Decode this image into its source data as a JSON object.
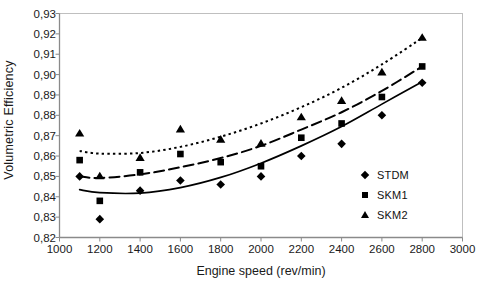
{
  "chart_data": {
    "type": "scatter",
    "title": "",
    "xlabel": "Engine speed (rev/min)",
    "ylabel": "Volumetric Efficiency",
    "xlim": [
      1000,
      3000
    ],
    "ylim": [
      0.82,
      0.93
    ],
    "xticks": [
      1000,
      1200,
      1400,
      1600,
      1800,
      2000,
      2200,
      2400,
      2600,
      2800,
      3000
    ],
    "xtick_labels": [
      "1000",
      "1200",
      "1400",
      "1600",
      "1800",
      "2000",
      "2200",
      "2400",
      "2600",
      "2800",
      "3000"
    ],
    "yticks": [
      0.82,
      0.83,
      0.84,
      0.85,
      0.86,
      0.87,
      0.88,
      0.89,
      0.9,
      0.91,
      0.92,
      0.93
    ],
    "ytick_labels": [
      "0,82",
      "0,83",
      "0,84",
      "0,85",
      "0,86",
      "0,87",
      "0,88",
      "0,89",
      "0,90",
      "0,91",
      "0,92",
      "0,93"
    ],
    "grid": false,
    "legend_position": "inside-right",
    "decimal_separator": ",",
    "x": [
      1100,
      1200,
      1400,
      1600,
      1800,
      2000,
      2200,
      2400,
      2600,
      2800
    ],
    "series": [
      {
        "name": "STDM",
        "marker": "diamond",
        "line_style": "solid",
        "color": "#000000",
        "values": [
          0.85,
          0.829,
          0.843,
          0.848,
          0.846,
          0.85,
          0.86,
          0.866,
          0.88,
          0.896
        ],
        "trend": [
          0.8435,
          0.842,
          0.8418,
          0.8445,
          0.8495,
          0.8565,
          0.865,
          0.8745,
          0.8855,
          0.8965
        ]
      },
      {
        "name": "SKM1",
        "marker": "square",
        "line_style": "dashed",
        "color": "#000000",
        "values": [
          0.858,
          0.838,
          0.852,
          0.861,
          0.857,
          0.855,
          0.869,
          0.876,
          0.889,
          0.904
        ],
        "trend": [
          0.85,
          0.8492,
          0.851,
          0.8545,
          0.859,
          0.865,
          0.873,
          0.8815,
          0.892,
          0.904
        ]
      },
      {
        "name": "SKM2",
        "marker": "triangle",
        "line_style": "dotted",
        "color": "#000000",
        "values": [
          0.871,
          0.85,
          0.859,
          0.873,
          0.868,
          0.866,
          0.879,
          0.887,
          0.901,
          0.918
        ],
        "trend": [
          0.8625,
          0.8612,
          0.8615,
          0.8645,
          0.8695,
          0.876,
          0.884,
          0.8935,
          0.905,
          0.918
        ]
      }
    ],
    "legend_entries": [
      {
        "label": "STDM",
        "marker": "diamond"
      },
      {
        "label": "SKM1",
        "marker": "square"
      },
      {
        "label": "SKM2",
        "marker": "triangle"
      }
    ]
  }
}
